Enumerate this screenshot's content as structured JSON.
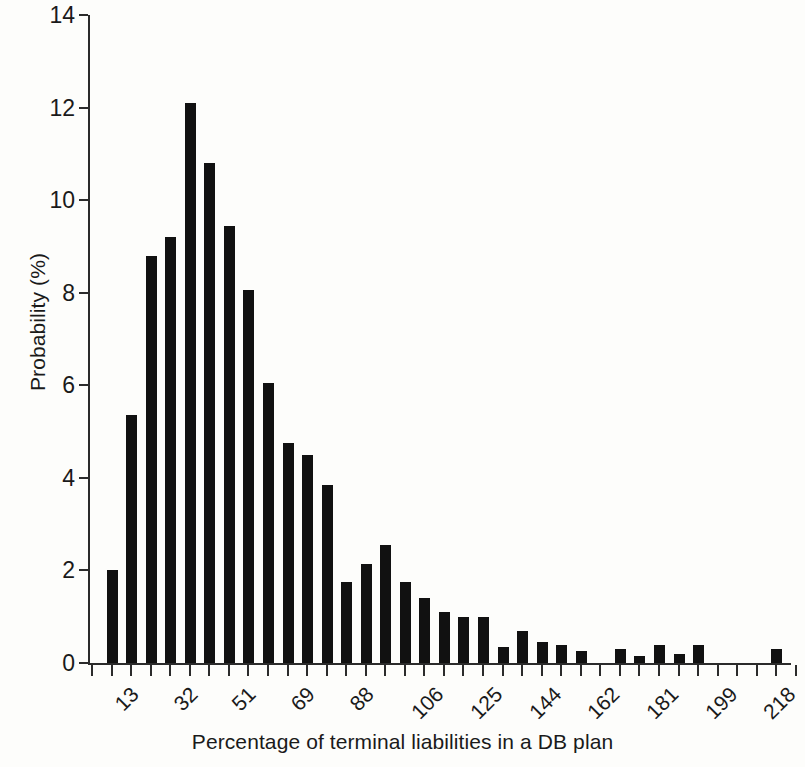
{
  "chart_data": {
    "type": "bar",
    "title": "",
    "subtitle": "",
    "xlabel": "Percentage of terminal liabilities in a DB plan",
    "ylabel": "Probability (%)",
    "ylim": [
      0,
      14
    ],
    "y_ticks": [
      0,
      2,
      4,
      6,
      8,
      10,
      12,
      14
    ],
    "x_tick_labels": [
      "13",
      "32",
      "51",
      "69",
      "88",
      "106",
      "125",
      "144",
      "162",
      "181",
      "199",
      "218",
      "236",
      "255"
    ],
    "x_tick_label_rotation_deg": 45,
    "grid": false,
    "legend": null,
    "bar_color": "#111111",
    "categories": [
      "13",
      "19",
      "25",
      "32",
      "38",
      "44",
      "51",
      "57",
      "63",
      "69",
      "75",
      "82",
      "88",
      "94",
      "100",
      "106",
      "113",
      "119",
      "125",
      "131",
      "137",
      "144",
      "150",
      "156",
      "162",
      "168",
      "175",
      "181",
      "187",
      "193",
      "199",
      "206",
      "212",
      "218",
      "224",
      "230",
      "236",
      "243",
      "249",
      "255"
    ],
    "values": [
      0,
      2.0,
      5.35,
      8.8,
      9.2,
      12.1,
      10.8,
      9.45,
      8.05,
      6.05,
      4.75,
      4.5,
      3.85,
      1.75,
      2.15,
      2.55,
      1.75,
      1.4,
      1.1,
      1.0,
      1.0,
      0.35,
      0.7,
      0.45,
      0.4,
      0.25,
      0,
      0.3,
      0.15,
      0.4,
      0.2,
      0.4,
      0,
      0,
      0,
      0.3,
      0,
      0.2,
      0,
      0
    ]
  }
}
